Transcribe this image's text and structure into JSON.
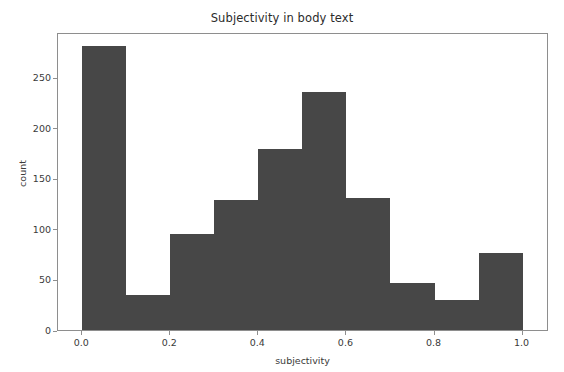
{
  "figure": {
    "width": 564,
    "height": 372,
    "background": "#ffffff",
    "axes_color": "#8e8e8e",
    "text_color": "#3a3a3a"
  },
  "chart_data": {
    "type": "bar",
    "subtype": "histogram",
    "title": "Subjectivity in body text",
    "xlabel": "subjectivity",
    "ylabel": "count",
    "bin_width": 0.1,
    "bin_edges": [
      0.0,
      0.1,
      0.2,
      0.3,
      0.4,
      0.5,
      0.6,
      0.7,
      0.8,
      0.9,
      1.0
    ],
    "categories": [
      "0.0-0.1",
      "0.1-0.2",
      "0.2-0.3",
      "0.3-0.4",
      "0.4-0.5",
      "0.5-0.6",
      "0.6-0.7",
      "0.7-0.8",
      "0.8-0.9",
      "0.9-1.0"
    ],
    "values": [
      281,
      35,
      95,
      129,
      179,
      236,
      131,
      47,
      30,
      76
    ],
    "bar_color": "#474747",
    "xlim": [
      -0.055,
      1.06
    ],
    "ylim": [
      0,
      295
    ],
    "xticks": [
      0.0,
      0.2,
      0.4,
      0.6,
      0.8,
      1.0
    ],
    "xticklabels": [
      "0.0",
      "0.2",
      "0.4",
      "0.6",
      "0.8",
      "1.0"
    ],
    "yticks": [
      0,
      50,
      100,
      150,
      200,
      250
    ],
    "yticklabels": [
      "0",
      "50",
      "100",
      "150",
      "200",
      "250"
    ],
    "grid": false,
    "legend": null,
    "legend_position": "none"
  }
}
